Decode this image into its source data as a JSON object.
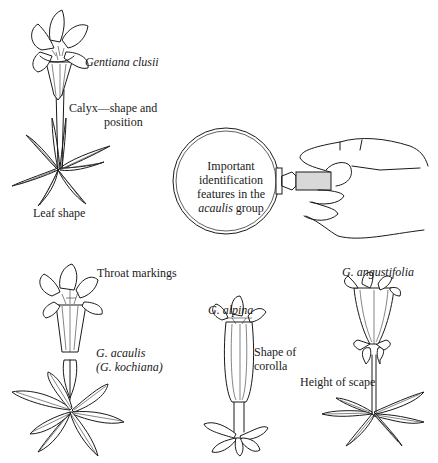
{
  "labels": {
    "gentiana_clusii": "Gentiana clusii",
    "calyx_line1": "Calyx—shape and",
    "calyx_line2": "position",
    "leaf_shape": "Leaf shape",
    "lens_line1": "Important",
    "lens_line2": "identification",
    "lens_line3": "features in the",
    "lens_line4_italic": "acaulis",
    "lens_line4_rest": " group",
    "throat_markings": "Throat markings",
    "g_acaulis_line1": "G. acaulis",
    "g_acaulis_line2": "(G. kochiana)",
    "g_alpina": "G. alpina",
    "shape_of_line1": "Shape of",
    "shape_of_line2": "corolla",
    "g_angustifolia": "G. angustifolia",
    "height_of_scape": "Height of scape"
  },
  "figures": [
    {
      "name": "Gentiana clusii",
      "feature": "Calyx shape and position; Leaf shape"
    },
    {
      "name": "magnifying glass held by hand",
      "feature": "Important identification features in the acaulis group"
    },
    {
      "name": "G. acaulis (G. kochiana)",
      "feature": "Throat markings"
    },
    {
      "name": "G. alpina",
      "feature": "Shape of corolla"
    },
    {
      "name": "G. angustifolia",
      "feature": "Height of scape"
    }
  ]
}
